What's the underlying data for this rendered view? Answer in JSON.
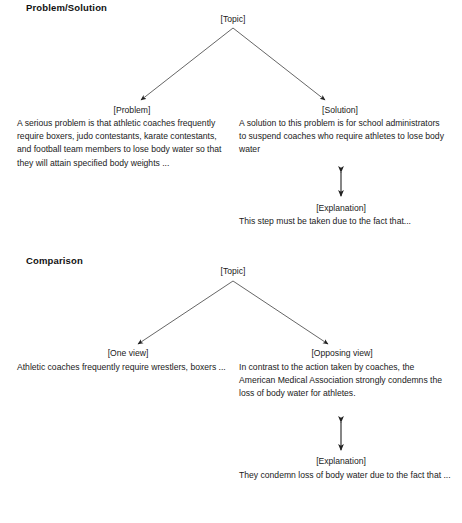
{
  "document": {
    "title": "Problem/Solution and Comparison text structure diagrams",
    "line_color": "#3a3a3a",
    "text_color": "#1a1a1a",
    "background": "#ffffff"
  },
  "sections": [
    {
      "heading": "Problem/Solution",
      "topic": "[Topic]",
      "left": {
        "label": "[Problem]",
        "text": "A serious problem is that athletic coaches frequently require boxers, judo contestants, karate contestants, and football team members to lose body water so that they will attain specified body weights ..."
      },
      "right": {
        "label": "[Solution]",
        "text": "A solution to this problem is for school administrators to suspend coaches who require athletes to lose body water"
      },
      "explanation": {
        "label": "[Explanation]",
        "text": "This step must be taken due to the fact that..."
      }
    },
    {
      "heading": "Comparison",
      "topic": "[Topic]",
      "left": {
        "label": "[One view]",
        "text": "Athletic coaches frequently require wrestlers, boxers ..."
      },
      "right": {
        "label": "[Opposing view]",
        "text": "In contrast to the action taken by coaches, the American Medical Association strongly condemns the loss of body water for athletes."
      },
      "explanation": {
        "label": "[Explanation]",
        "text": "They condemn loss of body water due to the fact that ..."
      }
    }
  ]
}
